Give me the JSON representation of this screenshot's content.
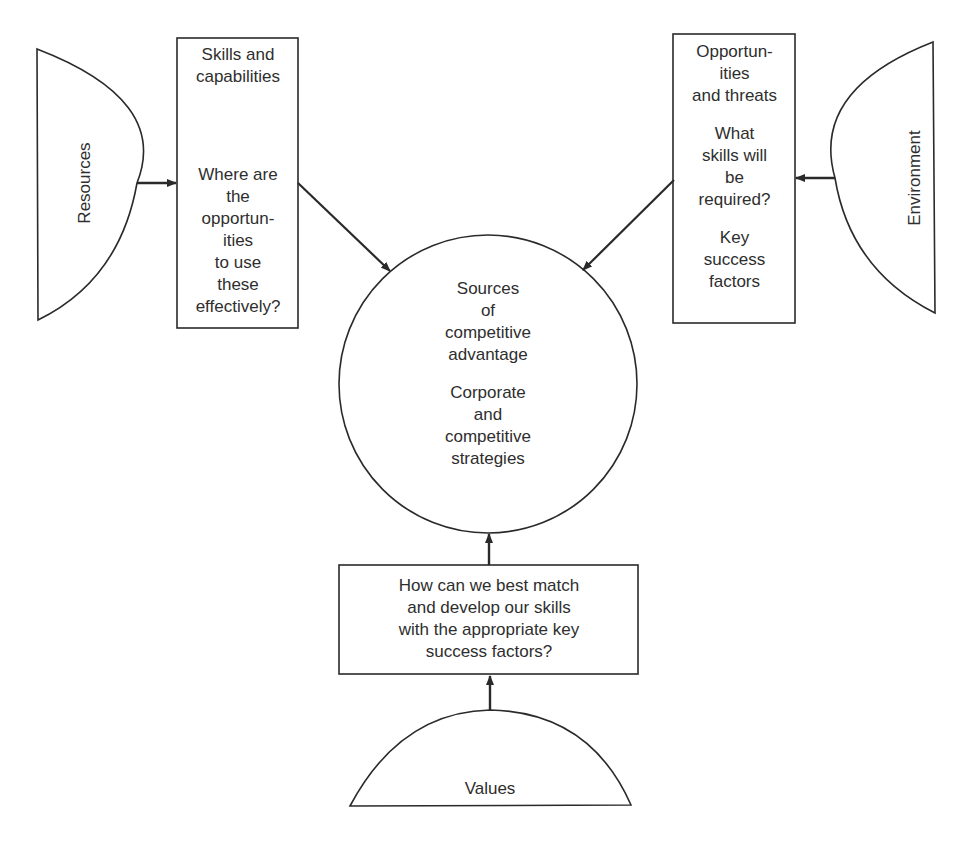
{
  "diagram": {
    "resources": {
      "label": "Resources"
    },
    "environment": {
      "label": "Environment"
    },
    "values": {
      "label": "Values"
    },
    "skills_box": {
      "title": "Skills and capabilities",
      "title_lines": [
        "Skills and",
        "capabilities"
      ],
      "question_lines": [
        "Where are",
        "the",
        "opportun-",
        "ities",
        "to use",
        "these",
        "effectively?"
      ]
    },
    "opportunities_box": {
      "title_lines": [
        "Opportun-",
        "ities",
        "and threats"
      ],
      "question_lines": [
        "What",
        "skills will",
        "be",
        "required?"
      ],
      "factors_lines": [
        "Key",
        "success",
        "factors"
      ]
    },
    "center_circle": {
      "top_lines": [
        "Sources",
        "of",
        "competitive",
        "advantage"
      ],
      "bottom_lines": [
        "Corporate",
        "and",
        "competitive",
        "strategies"
      ]
    },
    "match_box": {
      "lines": [
        "How can we best match",
        "and develop our skills",
        "with the appropriate key",
        "success factors?"
      ]
    },
    "connections": [
      {
        "from": "Resources",
        "to": "Skills and capabilities"
      },
      {
        "from": "Environment",
        "to": "Opportunities and threats"
      },
      {
        "from": "Skills and capabilities",
        "to": "Sources of competitive advantage"
      },
      {
        "from": "Opportunities and threats",
        "to": "Sources of competitive advantage"
      },
      {
        "from": "Values",
        "to": "How can we best match"
      },
      {
        "from": "How can we best match",
        "to": "Sources of competitive advantage"
      }
    ],
    "colors": {
      "stroke": "#2a2a2a",
      "background": "#ffffff"
    }
  }
}
